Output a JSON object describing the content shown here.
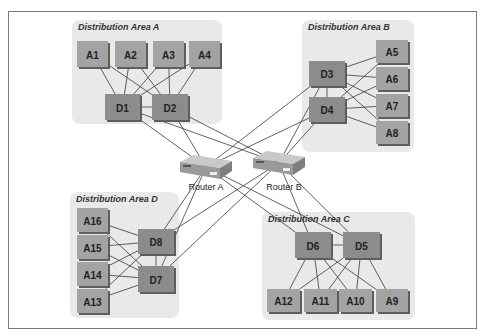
{
  "diagram": {
    "areas": [
      {
        "id": "A",
        "title": "Distribution Area A",
        "x": 72,
        "y": 20,
        "w": 150,
        "h": 104
      },
      {
        "id": "B",
        "title": "Distribution Area B",
        "x": 302,
        "y": 20,
        "w": 112,
        "h": 132
      },
      {
        "id": "C",
        "title": "Distribution Area C",
        "x": 262,
        "y": 212,
        "w": 153,
        "h": 108
      },
      {
        "id": "D",
        "title": "Distribution Area D",
        "x": 70,
        "y": 192,
        "w": 109,
        "h": 126
      }
    ],
    "access_nodes": [
      {
        "label": "A1",
        "x": 77,
        "y": 41,
        "w": 31,
        "h": 26
      },
      {
        "label": "A2",
        "x": 115,
        "y": 41,
        "w": 31,
        "h": 26
      },
      {
        "label": "A3",
        "x": 153,
        "y": 41,
        "w": 31,
        "h": 26
      },
      {
        "label": "A4",
        "x": 189,
        "y": 41,
        "w": 31,
        "h": 26
      },
      {
        "label": "A5",
        "x": 376,
        "y": 40,
        "w": 32,
        "h": 23
      },
      {
        "label": "A6",
        "x": 376,
        "y": 67,
        "w": 32,
        "h": 23
      },
      {
        "label": "A7",
        "x": 376,
        "y": 94,
        "w": 32,
        "h": 23
      },
      {
        "label": "A8",
        "x": 376,
        "y": 121,
        "w": 32,
        "h": 23
      },
      {
        "label": "A9",
        "x": 376,
        "y": 289,
        "w": 32,
        "h": 23
      },
      {
        "label": "A10",
        "x": 339,
        "y": 289,
        "w": 33,
        "h": 23
      },
      {
        "label": "A11",
        "x": 304,
        "y": 289,
        "w": 33,
        "h": 23
      },
      {
        "label": "A12",
        "x": 267,
        "y": 289,
        "w": 33,
        "h": 23
      },
      {
        "label": "A13",
        "x": 77,
        "y": 289,
        "w": 31,
        "h": 24
      },
      {
        "label": "A14",
        "x": 77,
        "y": 262,
        "w": 31,
        "h": 24
      },
      {
        "label": "A15",
        "x": 77,
        "y": 235,
        "w": 31,
        "h": 24
      },
      {
        "label": "A16",
        "x": 77,
        "y": 208,
        "w": 31,
        "h": 24
      }
    ],
    "distribution_nodes": [
      {
        "label": "D1",
        "x": 105,
        "y": 94,
        "w": 35,
        "h": 26
      },
      {
        "label": "D2",
        "x": 152,
        "y": 94,
        "w": 36,
        "h": 26
      },
      {
        "label": "D3",
        "x": 309,
        "y": 61,
        "w": 36,
        "h": 25
      },
      {
        "label": "D4",
        "x": 309,
        "y": 97,
        "w": 36,
        "h": 25
      },
      {
        "label": "D5",
        "x": 343,
        "y": 232,
        "w": 37,
        "h": 26
      },
      {
        "label": "D6",
        "x": 295,
        "y": 232,
        "w": 36,
        "h": 26
      },
      {
        "label": "D7",
        "x": 138,
        "y": 266,
        "w": 36,
        "h": 26
      },
      {
        "label": "D8",
        "x": 138,
        "y": 229,
        "w": 36,
        "h": 25
      }
    ],
    "routers": [
      {
        "label": "Router A",
        "x": 180,
        "y": 155,
        "label_x": 206,
        "label_y": 190
      },
      {
        "label": "Router B",
        "x": 253,
        "y": 151,
        "label_x": 284,
        "label_y": 190
      }
    ],
    "links": [
      [
        "A1",
        "D1"
      ],
      [
        "A1",
        "D2"
      ],
      [
        "A2",
        "D1"
      ],
      [
        "A2",
        "D2"
      ],
      [
        "A3",
        "D1"
      ],
      [
        "A3",
        "D2"
      ],
      [
        "A4",
        "D1"
      ],
      [
        "A4",
        "D2"
      ],
      [
        "D1",
        "D2"
      ],
      [
        "A5",
        "D3"
      ],
      [
        "A5",
        "D4"
      ],
      [
        "A6",
        "D3"
      ],
      [
        "A6",
        "D4"
      ],
      [
        "A7",
        "D3"
      ],
      [
        "A7",
        "D4"
      ],
      [
        "A8",
        "D3"
      ],
      [
        "A8",
        "D4"
      ],
      [
        "D3",
        "D4"
      ],
      [
        "A9",
        "D5"
      ],
      [
        "A9",
        "D6"
      ],
      [
        "A10",
        "D5"
      ],
      [
        "A10",
        "D6"
      ],
      [
        "A11",
        "D5"
      ],
      [
        "A11",
        "D6"
      ],
      [
        "A12",
        "D5"
      ],
      [
        "A12",
        "D6"
      ],
      [
        "D5",
        "D6"
      ],
      [
        "A13",
        "D7"
      ],
      [
        "A13",
        "D8"
      ],
      [
        "A14",
        "D7"
      ],
      [
        "A14",
        "D8"
      ],
      [
        "A15",
        "D7"
      ],
      [
        "A15",
        "D8"
      ],
      [
        "A16",
        "D7"
      ],
      [
        "A16",
        "D8"
      ],
      [
        "D7",
        "D8"
      ],
      [
        "D1",
        "Router A"
      ],
      [
        "D1",
        "Router B"
      ],
      [
        "D2",
        "Router A"
      ],
      [
        "D2",
        "Router B"
      ],
      [
        "D3",
        "Router A"
      ],
      [
        "D3",
        "Router B"
      ],
      [
        "D4",
        "Router A"
      ],
      [
        "D4",
        "Router B"
      ],
      [
        "D5",
        "Router A"
      ],
      [
        "D5",
        "Router B"
      ],
      [
        "D6",
        "Router A"
      ],
      [
        "D6",
        "Router B"
      ],
      [
        "D7",
        "Router A"
      ],
      [
        "D7",
        "Router B"
      ],
      [
        "D8",
        "Router A"
      ],
      [
        "D8",
        "Router B"
      ]
    ]
  }
}
